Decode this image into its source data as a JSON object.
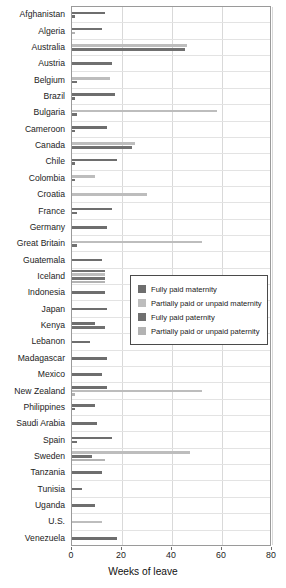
{
  "chart_data": {
    "type": "bar",
    "orientation": "horizontal",
    "title": "",
    "xlabel": "Weeks of leave",
    "ylabel": "",
    "xlim": [
      0,
      80
    ],
    "xticks": [
      0,
      20,
      40,
      60,
      80
    ],
    "grid": true,
    "legend_position": "center-right",
    "categories": [
      "Afghanistan",
      "Algeria",
      "Australia",
      "Austria",
      "Belgium",
      "Brazil",
      "Bulgaria",
      "Cameroon",
      "Canada",
      "Chile",
      "Colombia",
      "Croatia",
      "France",
      "Germany",
      "Great Britain",
      "Guatemala",
      "Iceland",
      "Indonesia",
      "Japan",
      "Kenya",
      "Lebanon",
      "Madagascar",
      "Mexico",
      "New Zealand",
      "Philippines",
      "Saudi Arabia",
      "Spain",
      "Sweden",
      "Tanzania",
      "Tunisia",
      "Uganda",
      "U.S.",
      "Venezuela"
    ],
    "series": [
      {
        "name": "Fully paid maternity",
        "color": "#6e6e6e",
        "values": [
          13,
          0,
          0,
          0,
          0,
          17,
          0,
          14,
          0,
          18,
          0,
          0,
          16,
          14,
          0,
          12,
          13,
          13,
          14,
          9,
          7,
          14,
          12,
          14,
          9,
          10,
          16,
          0,
          12,
          4,
          9,
          0,
          18
        ]
      },
      {
        "name": "Partially paid or unpaid maternity",
        "color": "#bdbdbd",
        "values": [
          0,
          0,
          46,
          0,
          15,
          0,
          58,
          0,
          25,
          0,
          9,
          30,
          0,
          0,
          52,
          0,
          13,
          0,
          0,
          0,
          0,
          0,
          0,
          52,
          0,
          0,
          0,
          47,
          0,
          0,
          0,
          12,
          0
        ]
      },
      {
        "name": "Fully paid paternity",
        "color": "#707070",
        "values": [
          1,
          12,
          45,
          16,
          2,
          1,
          2,
          1,
          24,
          1,
          1,
          0,
          2,
          0,
          2,
          0,
          13,
          0,
          0,
          13,
          0,
          0,
          0,
          0,
          1,
          0,
          2,
          8,
          0,
          0,
          0,
          0,
          0
        ]
      },
      {
        "name": "Partially paid or unpaid paternity",
        "color": "#b3b3b3",
        "values": [
          0,
          1,
          0,
          0,
          0,
          0,
          0,
          0,
          0,
          0,
          0,
          0,
          0,
          0,
          0,
          0,
          13,
          0,
          0,
          0,
          0,
          0,
          0,
          1,
          0,
          0,
          0,
          13,
          0,
          0,
          0,
          0,
          0
        ]
      }
    ]
  },
  "legend": {
    "items": [
      {
        "label": "Fully paid maternity"
      },
      {
        "label": "Partially paid or unpaid maternity"
      },
      {
        "label": "Fully paid paternity"
      },
      {
        "label": "Partially paid or unpaid paternity"
      }
    ]
  }
}
